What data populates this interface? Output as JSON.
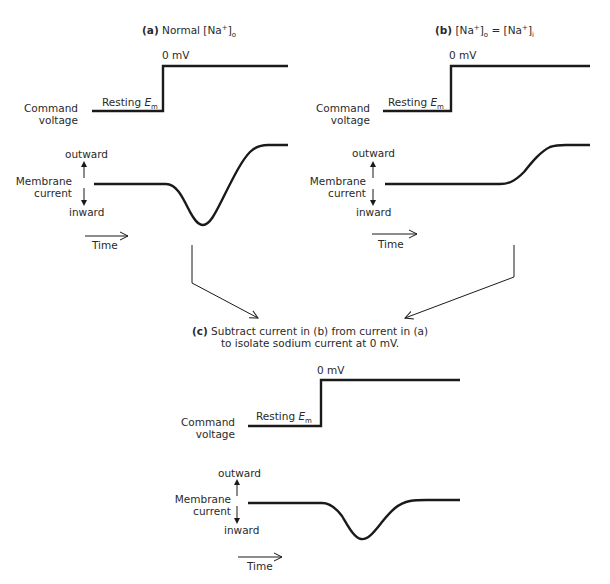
{
  "panel_a": {
    "tag": "(a)",
    "title": "Normal [Na",
    "title_sup": "+",
    "title_close": "]",
    "title_sub": "o",
    "step_top_label": "0 mV",
    "step_bottom_label": "Resting ",
    "em_label": "E",
    "em_sub": "m",
    "command_label_1": "Command",
    "command_label_2": "voltage",
    "outward_label": "outward",
    "membrane_label_1": "Membrane",
    "membrane_label_2": "current",
    "inward_label": "inward",
    "time_label": "Time"
  },
  "panel_b": {
    "tag": "(b)",
    "title_1": "[Na",
    "title_sup1": "+",
    "title_close1": "]",
    "title_sub1": "o",
    "title_eq": " = [Na",
    "title_sup2": "+",
    "title_close2": "]",
    "title_sub2": "i",
    "step_top_label": "0 mV",
    "step_bottom_label": "Resting ",
    "em_label": "E",
    "em_sub": "m",
    "command_label_1": "Command",
    "command_label_2": "voltage",
    "outward_label": "outward",
    "membrane_label_1": "Membrane",
    "membrane_label_2": "current",
    "inward_label": "inward",
    "time_label": "Time"
  },
  "panel_c": {
    "tag": "(c)",
    "caption_1": " Subtract current in (b) from current in (a)",
    "caption_2": "to isolate sodium current at 0 mV.",
    "step_top_label": "0 mV",
    "step_bottom_label": "Resting ",
    "em_label": "E",
    "em_sub": "m",
    "command_label_1": "Command",
    "command_label_2": "voltage",
    "outward_label": "outward",
    "membrane_label_1": "Membrane",
    "membrane_label_2": "current",
    "inward_label": "inward",
    "time_label": "Time"
  },
  "colors": {
    "ink": "#1a1a1a",
    "text": "#2a2a2a",
    "background": "#ffffff"
  }
}
